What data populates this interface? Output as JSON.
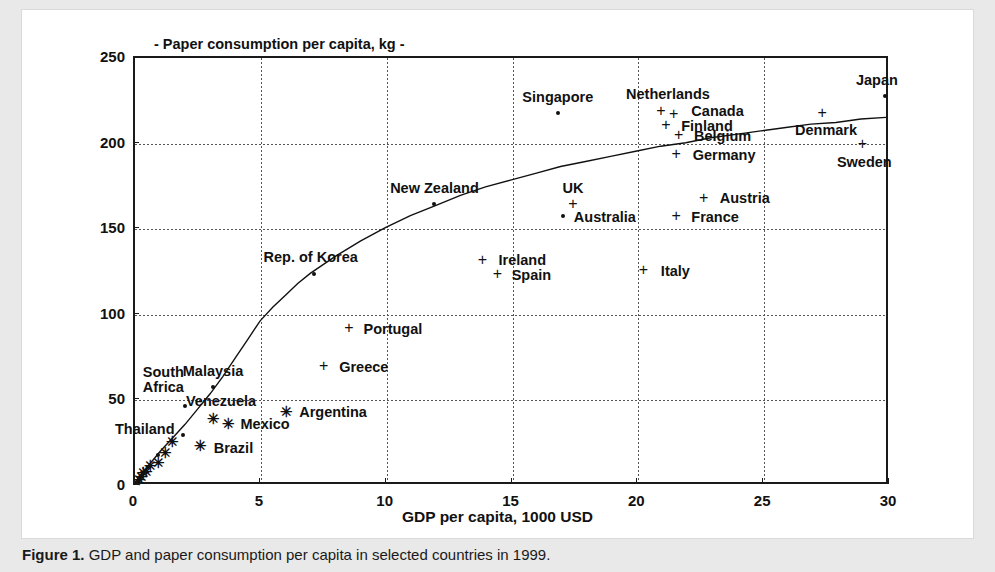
{
  "figure": {
    "caption_label": "Figure 1.",
    "caption_text": "GDP and paper consumption per capita in selected countries in 1999."
  },
  "chart_data": {
    "type": "scatter",
    "title": "- Paper consumption per capita, kg -",
    "xlabel": "GDP per capita, 1000 USD",
    "ylabel": "",
    "xlim": [
      0,
      30
    ],
    "ylim": [
      0,
      250
    ],
    "xticks": [
      0,
      5,
      10,
      15,
      20,
      25,
      30
    ],
    "yticks": [
      0,
      50,
      100,
      150,
      200,
      250
    ],
    "xtick_labels": [
      "0",
      "5",
      "10",
      "15",
      "20",
      "25",
      "30"
    ],
    "ytick_labels": [
      "0",
      "50",
      "100",
      "150",
      "200",
      "250"
    ],
    "grid": true,
    "legend": "none",
    "points": [
      {
        "label": "Japan",
        "x": 29.8,
        "y": 228,
        "marker": "dot",
        "label_dx": -8,
        "label_dy": -16,
        "label_anchor": "center"
      },
      {
        "label": "Denmark",
        "x": 27.3,
        "y": 218,
        "marker": "plus",
        "label_dx": 4,
        "label_dy": 17,
        "label_anchor": "center"
      },
      {
        "label": "Sweden",
        "x": 28.9,
        "y": 200,
        "marker": "plus",
        "label_dx": 2,
        "label_dy": 18,
        "label_anchor": "center"
      },
      {
        "label": "Netherlands",
        "x": 20.9,
        "y": 219,
        "marker": "plus",
        "label_dx": 7,
        "label_dy": -17,
        "label_anchor": "center"
      },
      {
        "label": "Canada",
        "x": 21.4,
        "y": 217,
        "marker": "plus",
        "label_dx": 44,
        "label_dy": -3,
        "label_anchor": "center"
      },
      {
        "label": "Finland",
        "x": 21.1,
        "y": 211,
        "marker": "plus",
        "label_dx": 41,
        "label_dy": 1,
        "label_anchor": "center"
      },
      {
        "label": "Belgium",
        "x": 21.6,
        "y": 205,
        "marker": "plus",
        "label_dx": 44,
        "label_dy": 1,
        "label_anchor": "center"
      },
      {
        "label": "Germany",
        "x": 21.5,
        "y": 194,
        "marker": "plus",
        "label_dx": 48,
        "label_dy": 1,
        "label_anchor": "center"
      },
      {
        "label": "Singapore",
        "x": 16.8,
        "y": 218,
        "marker": "dot",
        "label_dx": 0,
        "label_dy": -16,
        "label_anchor": "center"
      },
      {
        "label": "Austria",
        "x": 22.6,
        "y": 168,
        "marker": "plus",
        "label_dx": 41,
        "label_dy": 0,
        "label_anchor": "center"
      },
      {
        "label": "France",
        "x": 21.5,
        "y": 158,
        "marker": "plus",
        "label_dx": 39,
        "label_dy": 1,
        "label_anchor": "center"
      },
      {
        "label": "UK",
        "x": 17.4,
        "y": 165,
        "marker": "plus",
        "label_dx": 0,
        "label_dy": -16,
        "label_anchor": "center"
      },
      {
        "label": "Australia",
        "x": 17.0,
        "y": 158,
        "marker": "dot",
        "label_dx": 42,
        "label_dy": 1,
        "label_anchor": "center"
      },
      {
        "label": "New Zealand",
        "x": 11.9,
        "y": 165,
        "marker": "dot",
        "label_dx": 0,
        "label_dy": -16,
        "label_anchor": "center"
      },
      {
        "label": "Italy",
        "x": 20.2,
        "y": 126,
        "marker": "plus",
        "label_dx": 32,
        "label_dy": 1,
        "label_anchor": "center"
      },
      {
        "label": "Ireland",
        "x": 13.8,
        "y": 132,
        "marker": "plus",
        "label_dx": 40,
        "label_dy": 0,
        "label_anchor": "center"
      },
      {
        "label": "Spain",
        "x": 14.4,
        "y": 124,
        "marker": "plus",
        "label_dx": 34,
        "label_dy": 1,
        "label_anchor": "center"
      },
      {
        "label": "Rep. of Korea",
        "x": 7.1,
        "y": 124,
        "marker": "dot",
        "label_dx": -3,
        "label_dy": -17,
        "label_anchor": "center"
      },
      {
        "label": "Portugal",
        "x": 8.5,
        "y": 92,
        "marker": "plus",
        "label_dx": 44,
        "label_dy": 1,
        "label_anchor": "center"
      },
      {
        "label": "Greece",
        "x": 7.5,
        "y": 70,
        "marker": "plus",
        "label_dx": 40,
        "label_dy": 1,
        "label_anchor": "center"
      },
      {
        "label": "Malaysia",
        "x": 3.1,
        "y": 58,
        "marker": "dot",
        "label_dx": 0,
        "label_dy": -16,
        "label_anchor": "center"
      },
      {
        "label": "Argentina",
        "x": 6.0,
        "y": 44,
        "marker": "star",
        "label_dx": 47,
        "label_dy": 1,
        "label_anchor": "center"
      },
      {
        "label": "Venezuela",
        "x": 3.1,
        "y": 40,
        "marker": "star",
        "label_dx": 8,
        "label_dy": -17,
        "label_anchor": "center"
      },
      {
        "label": "Mexico",
        "x": 3.7,
        "y": 37,
        "marker": "star",
        "label_dx": 37,
        "label_dy": 1,
        "label_anchor": "center"
      },
      {
        "label": "South Africa",
        "x": 2.0,
        "y": 47,
        "marker": "dot",
        "label_dx": -22,
        "label_dy": -26,
        "label_anchor": "center"
      },
      {
        "label": "Thailand",
        "x": 1.5,
        "y": 26,
        "marker": "star",
        "label_dx": -28,
        "label_dy": -12,
        "label_anchor": "center"
      },
      {
        "label": "Brazil",
        "x": 2.6,
        "y": 24,
        "marker": "star",
        "label_dx": 33,
        "label_dy": 3,
        "label_anchor": "center"
      }
    ],
    "unlabeled_points": [
      {
        "x": 1.9,
        "y": 30,
        "marker": "dot"
      },
      {
        "x": 0.95,
        "y": 14,
        "marker": "star"
      },
      {
        "x": 0.9,
        "y": 18,
        "marker": "dot"
      },
      {
        "x": 0.45,
        "y": 9,
        "marker": "star"
      },
      {
        "x": 0.5,
        "y": 11,
        "marker": "dot"
      },
      {
        "x": 0.25,
        "y": 6,
        "marker": "star"
      },
      {
        "x": 0.18,
        "y": 4,
        "marker": "star"
      },
      {
        "x": 0.3,
        "y": 7,
        "marker": "dot"
      },
      {
        "x": 0.12,
        "y": 3,
        "marker": "dot"
      },
      {
        "x": 0.22,
        "y": 5,
        "marker": "dot"
      },
      {
        "x": 0.35,
        "y": 8,
        "marker": "star"
      },
      {
        "x": 0.6,
        "y": 12,
        "marker": "star"
      },
      {
        "x": 1.2,
        "y": 20,
        "marker": "star"
      }
    ],
    "trend_curve": [
      {
        "x": 0.0,
        "y": 0
      },
      {
        "x": 0.5,
        "y": 9
      },
      {
        "x": 1.0,
        "y": 18
      },
      {
        "x": 1.5,
        "y": 26
      },
      {
        "x": 2.0,
        "y": 34
      },
      {
        "x": 2.5,
        "y": 43
      },
      {
        "x": 3.0,
        "y": 52
      },
      {
        "x": 3.5,
        "y": 62
      },
      {
        "x": 4.0,
        "y": 73
      },
      {
        "x": 4.5,
        "y": 84
      },
      {
        "x": 5.0,
        "y": 95
      },
      {
        "x": 5.5,
        "y": 103
      },
      {
        "x": 6.0,
        "y": 110
      },
      {
        "x": 6.5,
        "y": 117
      },
      {
        "x": 7.0,
        "y": 123
      },
      {
        "x": 8.0,
        "y": 133
      },
      {
        "x": 9.0,
        "y": 142
      },
      {
        "x": 10.0,
        "y": 150
      },
      {
        "x": 11.0,
        "y": 157
      },
      {
        "x": 12.0,
        "y": 163
      },
      {
        "x": 13.0,
        "y": 169
      },
      {
        "x": 14.0,
        "y": 174
      },
      {
        "x": 15.0,
        "y": 178
      },
      {
        "x": 16.0,
        "y": 182
      },
      {
        "x": 17.0,
        "y": 186
      },
      {
        "x": 18.0,
        "y": 189
      },
      {
        "x": 19.0,
        "y": 192
      },
      {
        "x": 20.0,
        "y": 195
      },
      {
        "x": 21.0,
        "y": 198
      },
      {
        "x": 22.0,
        "y": 200
      },
      {
        "x": 23.0,
        "y": 203
      },
      {
        "x": 24.0,
        "y": 205
      },
      {
        "x": 25.0,
        "y": 207
      },
      {
        "x": 26.0,
        "y": 209
      },
      {
        "x": 27.0,
        "y": 211
      },
      {
        "x": 28.0,
        "y": 212
      },
      {
        "x": 29.0,
        "y": 214
      },
      {
        "x": 30.0,
        "y": 215
      }
    ]
  }
}
